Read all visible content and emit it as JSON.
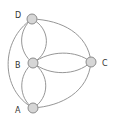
{
  "diagram": {
    "title": "",
    "nodes": [
      {
        "id": "D",
        "label": "D",
        "x": 32,
        "y": 19
      },
      {
        "id": "B",
        "label": "B",
        "x": 33,
        "y": 63
      },
      {
        "id": "C",
        "label": "C",
        "x": 91,
        "y": 62
      },
      {
        "id": "A",
        "label": "A",
        "x": 33,
        "y": 108
      }
    ],
    "edges": [
      {
        "from": "D",
        "to": "B",
        "count": 2
      },
      {
        "from": "B",
        "to": "A",
        "count": 2
      },
      {
        "from": "B",
        "to": "C",
        "count": 1
      },
      {
        "from": "D",
        "to": "C",
        "count": 1
      },
      {
        "from": "A",
        "to": "C",
        "count": 1
      },
      {
        "from": "D",
        "to": "A",
        "count": 1
      }
    ],
    "colors": {
      "node_fill": "#d6d6d6",
      "node_stroke": "#8c8c8c",
      "edge": "#8a8a8a"
    }
  }
}
